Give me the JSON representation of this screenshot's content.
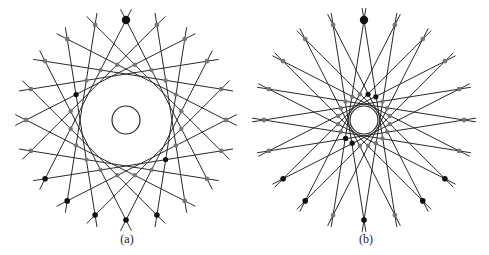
{
  "figure": {
    "background": "#ffffff",
    "line_color": "#2a2a2a",
    "dot_black": "#111111",
    "dot_gray": "#777777",
    "panels": [
      {
        "id": "a",
        "caption": "(a)",
        "center": [
          126,
          120
        ],
        "caption_x": 127,
        "n_outer": 20,
        "outer_radius": 100,
        "line_extension": 12,
        "skip": 7,
        "inner_circle_radius": 14,
        "middle_ring_radius": 56,
        "top_big_dot": true,
        "black_outer_indices": [
          0,
          11,
          12,
          13,
          9,
          10
        ],
        "black_middle_angles_deg": [
          38,
          50,
          198,
          212
        ]
      },
      {
        "id": "b",
        "caption": "(b)",
        "center": [
          364,
          120
        ],
        "caption_x": 366,
        "n_outer": 20,
        "outer_radius": 100,
        "line_extension": 12,
        "skip": 9,
        "inner_circle_radius": 14,
        "middle_ring_radius": 26,
        "top_big_dot": true,
        "black_outer_indices": [
          0,
          10,
          12,
          13,
          7,
          8
        ],
        "black_middle_angles_deg": [
          -60,
          -75,
          110,
          125,
          140
        ]
      }
    ]
  }
}
